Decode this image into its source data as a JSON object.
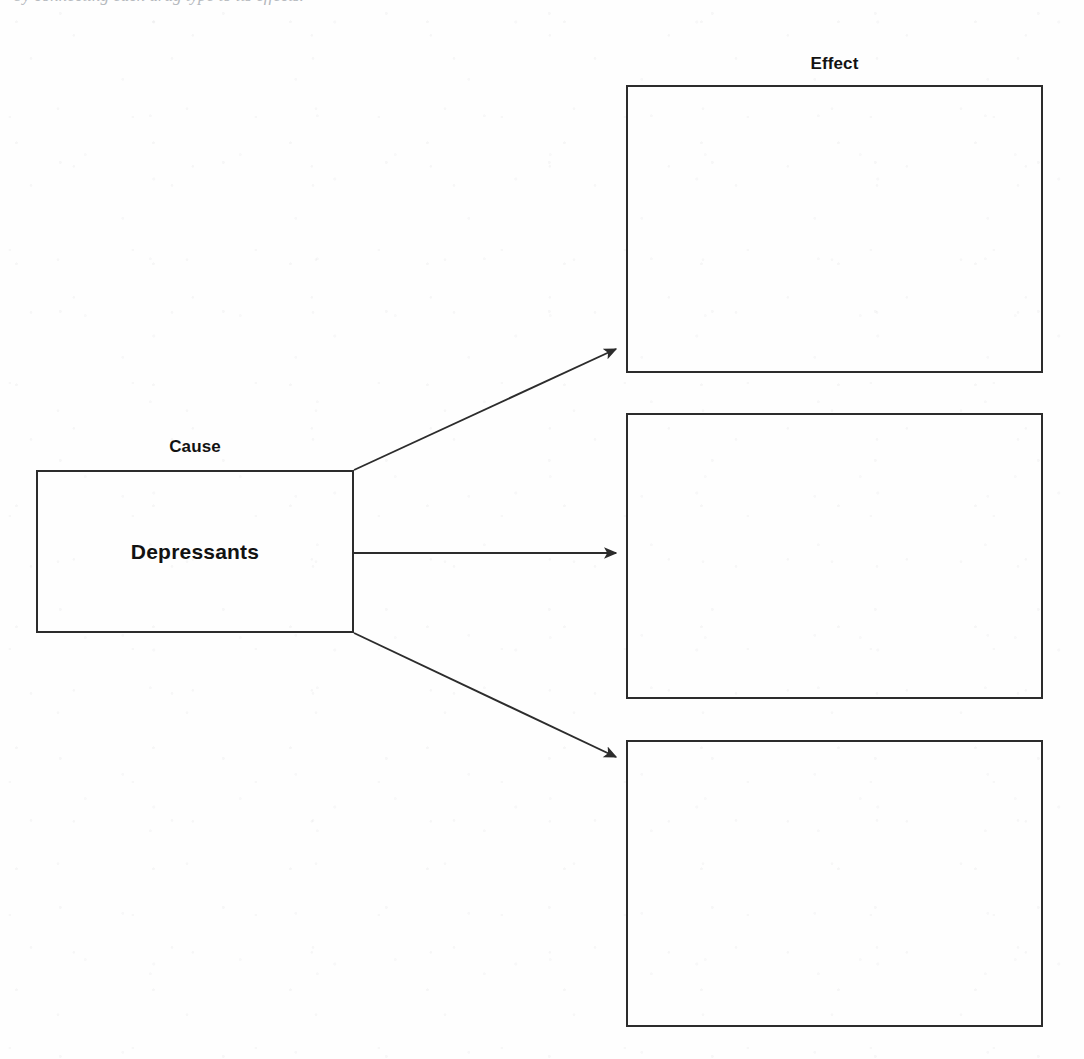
{
  "page": {
    "top_partial_line": "by connecting each drug type to its effects.",
    "background_color": "#fefefe",
    "ink_color": "#2c2c2c",
    "width": 1084,
    "height": 1059
  },
  "diagram": {
    "type": "cause-and-effect-graphic-organizer",
    "cause": {
      "heading": "Cause",
      "box_text": "Depressants",
      "box": {
        "x": 36,
        "y": 470,
        "width": 318,
        "height": 163
      }
    },
    "effect": {
      "heading": "Effect",
      "boxes": [
        {
          "text": "",
          "x": 626,
          "y": 85,
          "width": 417,
          "height": 288
        },
        {
          "text": "",
          "x": 626,
          "y": 413,
          "width": 417,
          "height": 286
        },
        {
          "text": "",
          "x": 626,
          "y": 740,
          "width": 417,
          "height": 287
        }
      ]
    },
    "arrows": [
      {
        "name": "arrow-to-effect-1",
        "from_x": 354,
        "from_y": 470,
        "to_x": 620,
        "to_y": 347
      },
      {
        "name": "arrow-to-effect-2",
        "from_x": 354,
        "from_y": 553,
        "to_x": 620,
        "to_y": 553
      },
      {
        "name": "arrow-to-effect-3",
        "from_x": 354,
        "from_y": 633,
        "to_x": 620,
        "to_y": 759
      }
    ]
  }
}
